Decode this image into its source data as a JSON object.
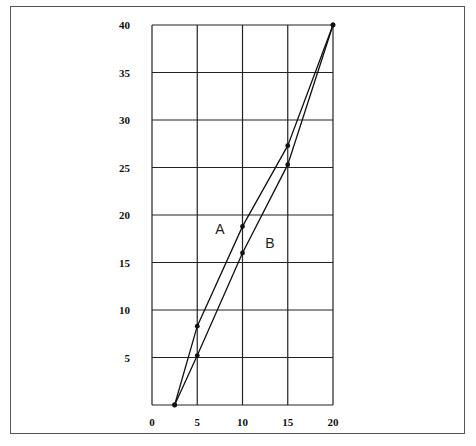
{
  "chart_data": {
    "type": "line",
    "title": "",
    "xlabel": "",
    "ylabel": "",
    "xlim": [
      0,
      20
    ],
    "ylim": [
      0,
      40
    ],
    "grid": true,
    "legend": "inline labels",
    "x_ticks": [
      "0",
      "5",
      "10",
      "15",
      "20"
    ],
    "y_ticks": [
      "5",
      "10",
      "15",
      "20",
      "25",
      "30",
      "35",
      "40"
    ],
    "series": [
      {
        "name": "A",
        "x": [
          2.5,
          5,
          10,
          15,
          20
        ],
        "values": [
          0,
          8.3,
          18.8,
          27.3,
          40
        ]
      },
      {
        "name": "B",
        "x": [
          2.5,
          5,
          10,
          15,
          20
        ],
        "values": [
          0,
          5.2,
          16.0,
          25.3,
          40
        ]
      }
    ],
    "annotations": [
      {
        "text": "A",
        "x": 7.0,
        "y": 18.0
      },
      {
        "text": "B",
        "x": 12.5,
        "y": 16.5
      }
    ]
  }
}
